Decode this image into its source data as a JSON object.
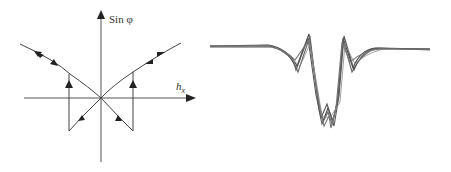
{
  "left_diagram": {
    "y_axis_label": "Sin φ",
    "x_axis_label": "h",
    "x_axis_subscript": "x",
    "stroke_color": "#333333"
  },
  "right_diagram": {
    "description": "overlaid signal traces with central V-shaped dip and side peaks",
    "stroke_color": "#444444"
  }
}
